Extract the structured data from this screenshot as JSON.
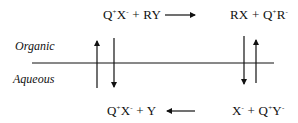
{
  "diagram": {
    "type": "phase-transfer-catalysis-cycle",
    "phases": {
      "upper": "Organic",
      "lower": "Aqueous"
    },
    "reactions": {
      "organic_left": {
        "species1": {
          "base": "Q",
          "sup1": "+",
          "mid": "X",
          "sup2": "-"
        },
        "plus": "+",
        "species2": "RY"
      },
      "organic_right": {
        "species1": "RX",
        "plus": "+",
        "species2": {
          "base": "Q",
          "sup1": "+",
          "mid": "R",
          "sup2": "-"
        }
      },
      "aqueous_left": {
        "species1": {
          "base": "Q",
          "sup1": "+",
          "mid": "X",
          "sup2": "-"
        },
        "plus": "+",
        "species2": "Y"
      },
      "aqueous_right": {
        "species1": {
          "base": "X",
          "sup1": "-"
        },
        "plus": "+",
        "species2": {
          "base": "Q",
          "sup1": "+",
          "mid": "Y",
          "sup2": "-"
        }
      }
    },
    "arrows": [
      {
        "id": "organic-forward",
        "direction": "right",
        "from": "organic_left",
        "to": "organic_right"
      },
      {
        "id": "aqueous-backward",
        "direction": "left",
        "from": "aqueous_right",
        "to": "aqueous_left"
      },
      {
        "id": "left-up",
        "direction": "up",
        "from": "aqueous_left",
        "to": "organic_left"
      },
      {
        "id": "left-down",
        "direction": "down",
        "from": "organic_left",
        "to": "aqueous_left"
      },
      {
        "id": "right-down",
        "direction": "down",
        "from": "organic_right",
        "to": "aqueous_right"
      },
      {
        "id": "right-up",
        "direction": "up",
        "from": "aqueous_right",
        "to": "organic_right"
      }
    ],
    "colors": {
      "ink": "#111111",
      "background": "#ffffff"
    }
  }
}
